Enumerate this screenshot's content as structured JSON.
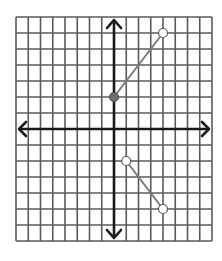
{
  "chart_data": {
    "type": "line",
    "title": "",
    "xlabel": "",
    "ylabel": "",
    "xlim": [
      -8,
      8
    ],
    "ylim": [
      -7,
      7
    ],
    "grid": true,
    "axes_arrows": true,
    "series": [
      {
        "name": "segment-1",
        "points": [
          [
            0,
            2
          ],
          [
            4,
            6
          ]
        ],
        "endpoints": [
          "closed",
          "open"
        ]
      },
      {
        "name": "segment-2",
        "points": [
          [
            1,
            -2
          ],
          [
            4,
            -5
          ]
        ],
        "endpoints": [
          "open",
          "open"
        ]
      }
    ]
  },
  "style": {
    "grid_color": "#5a5a5a",
    "axis_color": "#1a1a1a",
    "line_color": "#7a7a7a",
    "point_fill_closed": "#6e6e6e",
    "point_fill_open": "#ffffff"
  },
  "layout": {
    "origin_px": [
      114,
      129
    ],
    "unit_x_px": 12.25,
    "unit_y_px": 16,
    "grid_left_px": 16,
    "grid_right_px": 212,
    "grid_top_px": 17,
    "grid_bottom_px": 245
  }
}
